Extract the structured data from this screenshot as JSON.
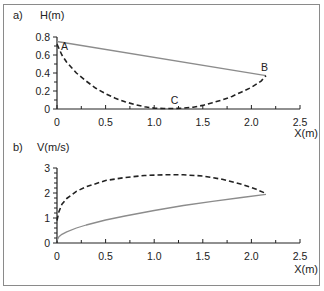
{
  "figure": {
    "border_color": "#8a8a8a",
    "line_colors": {
      "solid": "#8c8c8c",
      "dashed": "#222222",
      "axis": "#222222"
    }
  },
  "chart_data": [
    {
      "panel_label": "a)",
      "type": "line",
      "title": "",
      "xlabel": "X(m)",
      "ylabel": "H(m)",
      "xlim": [
        0,
        2.5
      ],
      "ylim": [
        0,
        0.8
      ],
      "x_ticks": [
        "0",
        "0.5",
        "1.0",
        "1.5",
        "2.0",
        "2.5"
      ],
      "y_ticks": [
        "0",
        "0.2",
        "0.4",
        "0.6",
        "0.8"
      ],
      "grid": false,
      "legend": null,
      "annotations": [
        {
          "text": "A",
          "x": 0.04,
          "y": 0.66
        },
        {
          "text": "B",
          "x": 2.1,
          "y": 0.42
        },
        {
          "text": "C",
          "x": 1.17,
          "y": 0.06
        }
      ],
      "series": [
        {
          "name": "solid",
          "style": "solid",
          "x": [
            0,
            2.15
          ],
          "y": [
            0.75,
            0.37
          ]
        },
        {
          "name": "dashed",
          "style": "dashed",
          "x": [
            0,
            0.05,
            0.1,
            0.2,
            0.3,
            0.4,
            0.5,
            0.6,
            0.7,
            0.8,
            0.9,
            1.0,
            1.1,
            1.2,
            1.3,
            1.4,
            1.5,
            1.6,
            1.7,
            1.8,
            1.9,
            2.0,
            2.1,
            2.15
          ],
          "y": [
            0.72,
            0.6,
            0.52,
            0.4,
            0.31,
            0.23,
            0.17,
            0.12,
            0.08,
            0.05,
            0.025,
            0.01,
            0.005,
            0.005,
            0.01,
            0.02,
            0.04,
            0.07,
            0.1,
            0.14,
            0.19,
            0.24,
            0.31,
            0.37
          ]
        }
      ]
    },
    {
      "panel_label": "b)",
      "type": "line",
      "title": "",
      "xlabel": "X(m)",
      "ylabel": "V(m/s)",
      "xlim": [
        0,
        2.5
      ],
      "ylim": [
        0,
        3
      ],
      "x_ticks": [
        "0",
        "0.5",
        "1.0",
        "1.5",
        "2.0",
        "2.5"
      ],
      "y_ticks": [
        "0",
        "1",
        "2",
        "3"
      ],
      "grid": false,
      "legend": null,
      "annotations": [],
      "series": [
        {
          "name": "solid",
          "style": "solid",
          "x": [
            0,
            0.02,
            0.05,
            0.1,
            0.2,
            0.3,
            0.5,
            0.7,
            1.0,
            1.3,
            1.6,
            1.9,
            2.15
          ],
          "y": [
            0.1,
            0.25,
            0.35,
            0.45,
            0.6,
            0.72,
            0.92,
            1.08,
            1.3,
            1.5,
            1.67,
            1.82,
            1.95
          ]
        },
        {
          "name": "dashed",
          "style": "dashed",
          "x": [
            0,
            0.02,
            0.05,
            0.1,
            0.2,
            0.3,
            0.5,
            0.7,
            0.9,
            1.1,
            1.3,
            1.5,
            1.7,
            1.9,
            2.05,
            2.15
          ],
          "y": [
            0.9,
            1.25,
            1.55,
            1.78,
            2.07,
            2.25,
            2.5,
            2.62,
            2.7,
            2.73,
            2.73,
            2.68,
            2.55,
            2.35,
            2.15,
            1.98
          ]
        }
      ]
    }
  ]
}
